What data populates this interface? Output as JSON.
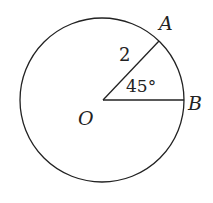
{
  "diagram": {
    "type": "circle-sector",
    "center_label": "O",
    "point_a_label": "A",
    "point_b_label": "B",
    "radius_label": "2",
    "angle_label": "45°",
    "colors": {
      "stroke": "#222222",
      "background": "#ffffff"
    }
  }
}
